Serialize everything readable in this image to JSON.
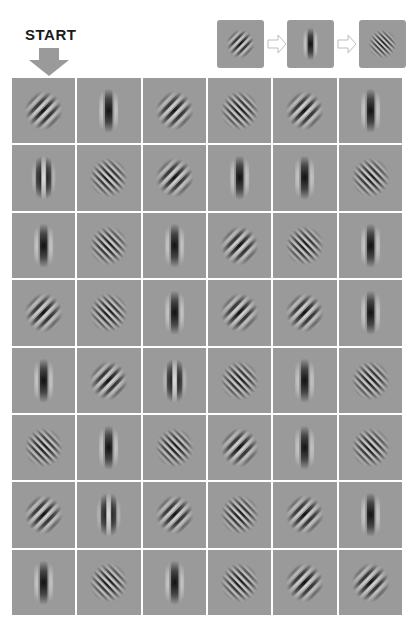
{
  "start": {
    "label": "START",
    "arrow_color": "#9a9a9a"
  },
  "legend": {
    "sequence": [
      "R",
      "V",
      "L"
    ],
    "arrow_icon": "outline-right-arrow"
  },
  "patch_types": {
    "R": "diagonal stripes lower-left to upper-right (coarse)",
    "L": "diagonal stripes upper-left to lower-right (fine)",
    "V": "vertical single dark bar",
    "V2": "vertical paired dark bars"
  },
  "colors": {
    "patch_bg": "#9a9a9a",
    "grid_line": "#ffffff",
    "dark": "#111111",
    "light": "#d8d8d8"
  },
  "grid": {
    "rows": 8,
    "cols": 6,
    "cells": [
      [
        "R",
        "V",
        "R",
        "L",
        "R",
        "V"
      ],
      [
        "V2",
        "L",
        "R",
        "V",
        "V",
        "L"
      ],
      [
        "V",
        "L",
        "V",
        "R",
        "L",
        "V"
      ],
      [
        "R",
        "L",
        "V",
        "R",
        "R",
        "V"
      ],
      [
        "V",
        "R",
        "V2",
        "L",
        "V",
        "L"
      ],
      [
        "L",
        "V",
        "L",
        "R",
        "V",
        "L"
      ],
      [
        "R",
        "V2",
        "R",
        "L",
        "R",
        "V"
      ],
      [
        "V",
        "L",
        "V",
        "L",
        "R",
        "R"
      ]
    ]
  }
}
